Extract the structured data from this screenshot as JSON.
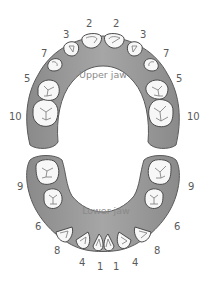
{
  "diagram": {
    "type": "dental-arch-tooth-eruption-order",
    "colors": {
      "gum_fill": "#9a9a9a",
      "gum_dark": "#6e6e6e",
      "tooth_fill": "#f7f7f7",
      "tooth_outline": "#4a4a4a",
      "label_text": "#5a5a5a",
      "jaw_label_text": "#8a8a8a",
      "background": "#ffffff"
    },
    "upper_jaw": {
      "label": "Upper jaw",
      "teeth_numbers_left_to_right": [
        "10",
        "5",
        "7",
        "3",
        "2",
        "2",
        "3",
        "7",
        "5",
        "10"
      ],
      "labels": {
        "left_molar2": "10",
        "left_molar1": "5",
        "left_canine": "7",
        "left_lateral": "3",
        "left_central": "2",
        "right_central": "2",
        "right_lateral": "3",
        "right_canine": "7",
        "right_molar1": "5",
        "right_molar2": "10"
      }
    },
    "lower_jaw": {
      "label": "Lower jaw",
      "teeth_numbers_left_to_right": [
        "9",
        "6",
        "8",
        "4",
        "1",
        "1",
        "4",
        "8",
        "6",
        "9"
      ],
      "labels": {
        "left_molar2": "9",
        "left_molar1": "6",
        "left_canine": "8",
        "left_lateral": "4",
        "left_central": "1",
        "right_central": "1",
        "right_lateral": "4",
        "right_canine": "8",
        "right_molar1": "6",
        "right_molar2": "9"
      }
    }
  }
}
